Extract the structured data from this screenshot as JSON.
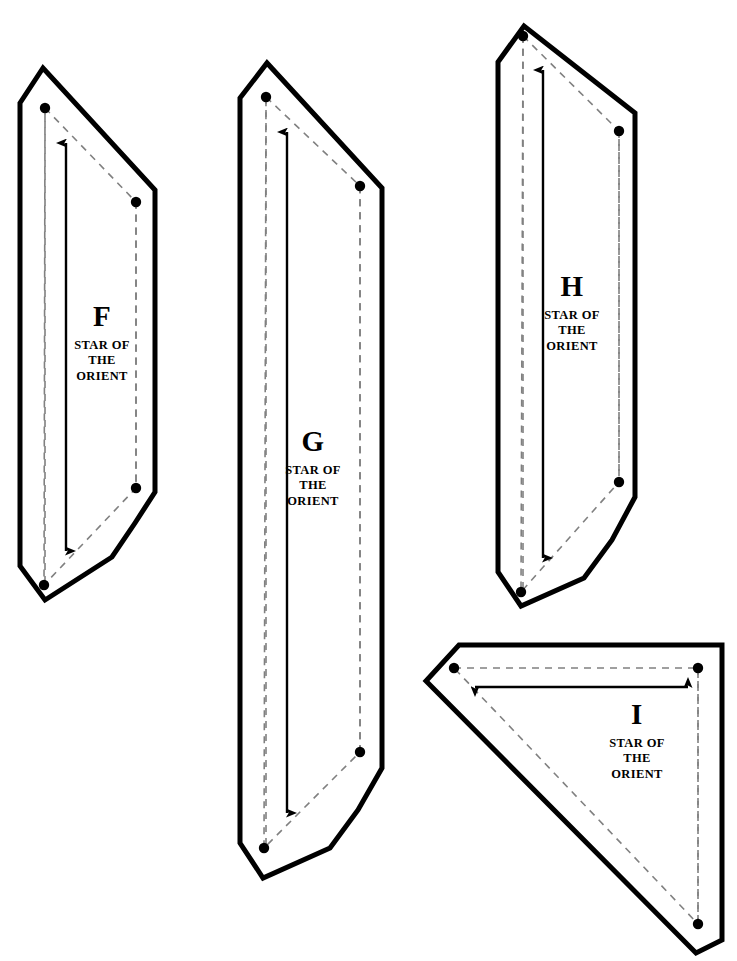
{
  "sheet": {
    "title": "Star of the Orient quilt pattern template sheet",
    "background_color": "#ffffff",
    "cut_line_color": "#000000",
    "seam_line_color": "#808080",
    "dot_color": "#000000",
    "arrow_color": "#000000",
    "width": 737,
    "height": 961
  },
  "pattern_name_lines": [
    "STAR OF",
    "THE",
    "ORIENT"
  ],
  "pieces": [
    {
      "id": "piece-f",
      "letter": "F",
      "name_line_1": "STAR OF",
      "name_line_2": "THE",
      "name_line_3": "ORIENT",
      "shape": "parallelogram",
      "grain_arrow": "vertical-double",
      "label_x": 102,
      "label_y": 302,
      "cut_outline": "20,103 43,68 155,190 155,492 135,523 112,557 45,600 20,566",
      "seam_outline": "45,108 136,202 136,488 44,585",
      "dots": [
        [
          45,
          108
        ],
        [
          136,
          202
        ],
        [
          136,
          488
        ],
        [
          44,
          585
        ]
      ],
      "grain_line": {
        "x": 66,
        "y_top": 143,
        "y_bottom": 551
      },
      "vertical_dashes": [
        {
          "x": 45,
          "y_top": 108,
          "y_bottom": 585
        },
        {
          "x": 136,
          "y_top": 202,
          "y_bottom": 488
        }
      ]
    },
    {
      "id": "piece-g",
      "letter": "G",
      "name_line_1": "STAR OF",
      "name_line_2": "THE",
      "name_line_3": "ORIENT",
      "shape": "parallelogram",
      "grain_arrow": "vertical-double",
      "label_x": 313,
      "label_y": 427,
      "cut_outline": "240,98 267,63 382,188 382,768 358,810 330,848 263,878 240,843",
      "seam_outline": "266,97 360,186 360,752 264,848",
      "dots": [
        [
          266,
          97
        ],
        [
          360,
          186
        ],
        [
          360,
          752
        ],
        [
          264,
          848
        ]
      ],
      "grain_line": {
        "x": 287,
        "y_top": 132,
        "y_bottom": 813
      },
      "vertical_dashes": [
        {
          "x": 266,
          "y_top": 97,
          "y_bottom": 848
        },
        {
          "x": 360,
          "y_top": 186,
          "y_bottom": 752
        }
      ]
    },
    {
      "id": "piece-h",
      "letter": "H",
      "name_line_1": "STAR OF",
      "name_line_2": "THE",
      "name_line_3": "ORIENT",
      "shape": "parallelogram",
      "grain_arrow": "vertical-double",
      "label_x": 572,
      "label_y": 272,
      "cut_outline": "498,62 524,26 635,113 635,497 612,540 584,578 521,606 498,572",
      "seam_outline": "523,36 619,131 619,482 521,592",
      "dots": [
        [
          523,
          36
        ],
        [
          619,
          131
        ],
        [
          619,
          482
        ],
        [
          521,
          592
        ]
      ],
      "grain_line": {
        "x": 543,
        "y_top": 70,
        "y_bottom": 558
      },
      "vertical_dashes": [
        {
          "x": 523,
          "y_top": 36,
          "y_bottom": 592
        },
        {
          "x": 619,
          "y_top": 131,
          "y_bottom": 482
        }
      ]
    },
    {
      "id": "piece-i",
      "letter": "I",
      "name_line_1": "STAR OF",
      "name_line_2": "THE",
      "name_line_3": "ORIENT",
      "shape": "right-triangle",
      "grain_arrow": "horizontal-double",
      "label_x": 637,
      "label_y": 700,
      "cut_outline": "459,645 722,645 722,940 696,953 426,681",
      "seam_outline": "454,668 698,668 698,924",
      "dots": [
        [
          454,
          668
        ],
        [
          698,
          668
        ],
        [
          698,
          924
        ]
      ],
      "grain_line": {
        "y": 687,
        "x_left": 475,
        "x_right": 688
      },
      "vertical_dashes": [
        {
          "x": 698,
          "y_top": 668,
          "y_bottom": 924
        }
      ]
    }
  ]
}
